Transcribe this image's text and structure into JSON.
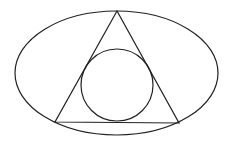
{
  "diagram": {
    "stroke_color": "#222222",
    "background": "#ffffff",
    "ellipse": {
      "cx": 116.5,
      "cy": 73,
      "rx": 101.5,
      "ry": 62
    },
    "triangle": {
      "points": [
        [
          117,
          11
        ],
        [
          55,
          122
        ],
        [
          179,
          123
        ]
      ]
    },
    "circle": {
      "cx": 117,
      "cy": 85,
      "r": 36
    }
  }
}
